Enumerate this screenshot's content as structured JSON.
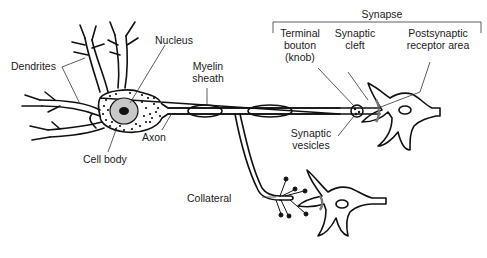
{
  "diagram": {
    "type": "neuron-anatomy",
    "labels": {
      "dendrites": "Dendrites",
      "nucleus": "Nucleus",
      "myelin_sheath": "Myelin\nsheath",
      "axon": "Axon",
      "cell_body": "Cell body",
      "synapse": "Synapse",
      "terminal_bouton": "Terminal\nbouton\n(knob)",
      "synaptic_cleft": "Synaptic\ncleft",
      "postsynaptic_receptor_area": "Postsynaptic\nreceptor area",
      "synaptic_vesicles": "Synaptic\nvesicles",
      "collateral": "Collateral"
    },
    "colors": {
      "line": "#111111",
      "nucleus_fill": "#c8c8c8",
      "nucleolus_fill": "#111111",
      "leader": "#333333"
    }
  }
}
